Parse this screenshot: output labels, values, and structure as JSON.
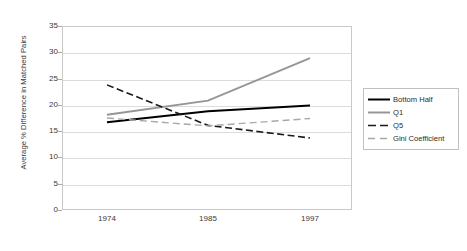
{
  "chart_data": {
    "type": "line",
    "title": "",
    "xlabel": "",
    "ylabel": "Average % Difference in Matched Pairs",
    "categories": [
      "1974",
      "1985",
      "1997"
    ],
    "x": [
      1974,
      1985,
      1997
    ],
    "ylim": [
      0,
      35
    ],
    "yticks": [
      0,
      5,
      10,
      15,
      20,
      25,
      30,
      35
    ],
    "grid": true,
    "legend_position": "right",
    "series": [
      {
        "name": "Bottom Half",
        "values": [
          16.7,
          18.8,
          19.9
        ],
        "color": "#000000",
        "style": "solid",
        "width": 2
      },
      {
        "name": "Q1",
        "values": [
          18.1,
          20.8,
          28.9
        ],
        "color": "#969696",
        "style": "solid",
        "width": 2
      },
      {
        "name": "Q5",
        "values": [
          23.8,
          16.1,
          13.7
        ],
        "color": "#1a1a1a",
        "style": "dashed",
        "width": 1.6
      },
      {
        "name": "Gini Coefficient",
        "values": [
          17.5,
          16.0,
          17.4
        ],
        "color": "#a8a8a8",
        "style": "dashed",
        "width": 1.4
      }
    ]
  },
  "legend": {
    "items": [
      {
        "label": "Bottom Half"
      },
      {
        "label": "Q1"
      },
      {
        "label": "Q5"
      },
      {
        "label": "Gini Coefficient"
      }
    ]
  }
}
